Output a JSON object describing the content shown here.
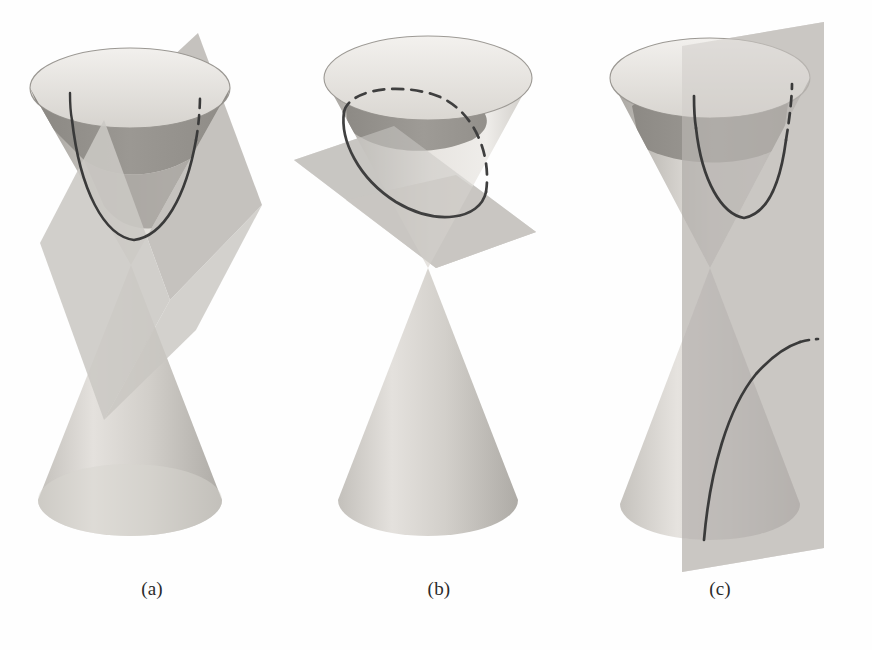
{
  "figure": {
    "background_color": "#fefefe",
    "width": 872,
    "height": 650
  },
  "palette": {
    "cone_outer_light": "#e6e4e0",
    "cone_outer_mid": "#c9c6c1",
    "cone_outer_dark": "#a5a2 9d",
    "cone_inside_dark": "#8e8b86",
    "cone_inside_mid": "#b0ada8",
    "plane_gray": "#c6c4c0",
    "plane_gray_dark": "#a9a7a3",
    "curve_stroke": "#3a3a3a",
    "rim_stroke": "#8b8884",
    "caption_color": "#2b2b2b"
  },
  "panels": [
    {
      "id": "a",
      "caption": "(a)",
      "conic_name": "parabola",
      "plane_orientation": "oblique, parallel to one generating line",
      "cut_nappes": 1,
      "curve_style": "solid-front-dashed-back"
    },
    {
      "id": "b",
      "caption": "(b)",
      "conic_name": "ellipse",
      "plane_orientation": "oblique, cuts every generating line of one nappe",
      "cut_nappes": 1,
      "curve_style": "solid-front-dashed-back"
    },
    {
      "id": "c",
      "caption": "(c)",
      "conic_name": "hyperbola",
      "plane_orientation": "vertical, parallel to the cone axis",
      "cut_nappes": 2,
      "curve_style": "solid-front-dashed-back"
    }
  ],
  "captions": {
    "a": "(a)",
    "b": "(b)",
    "c": "(c)"
  }
}
